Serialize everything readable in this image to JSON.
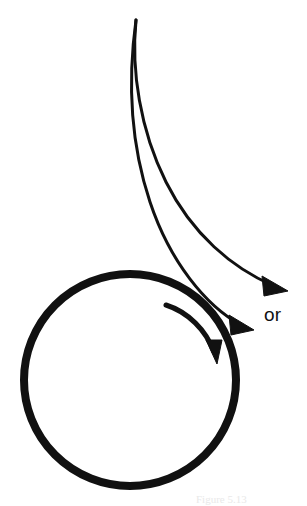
{
  "figure": {
    "background_color": "#ffffff",
    "ink_color": "#111111",
    "width": 307,
    "height": 506
  },
  "labels": {
    "or": "or",
    "caption_faint": "Figure 5.13"
  },
  "elements": {
    "ball": {
      "name": "ball-circle",
      "center_x": 130,
      "center_y": 380,
      "radius": 106,
      "stroke_width": 8,
      "color": "#111111"
    },
    "spin_arrow": {
      "name": "spin-arrow",
      "description": "clockwise rotation arrow inside ball",
      "direction": "clockwise",
      "stroke_width": 5,
      "color": "#111111"
    },
    "trajectory_upper": {
      "name": "trajectory-upper-curve",
      "description": "upper alternative deflected path ending in arrowhead",
      "stroke_width": 3,
      "color": "#111111",
      "arrow_tip_x": 287,
      "arrow_tip_y": 290
    },
    "trajectory_lower": {
      "name": "trajectory-lower-curve",
      "description": "lower alternative deflected path ending in arrowhead",
      "stroke_width": 3,
      "color": "#111111",
      "arrow_tip_x": 253,
      "arrow_tip_y": 329
    }
  }
}
